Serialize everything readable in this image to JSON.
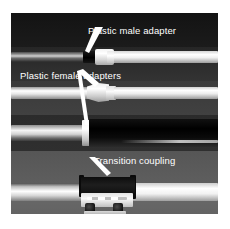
{
  "figure": {
    "kind": "photograph",
    "background_color": "#ffffff",
    "photo_background_color": "#2e2e2e",
    "label_color": "#ffffff",
    "leader_color": "#ffffff"
  },
  "annotations": [
    {
      "id": "plastic-male-adapter",
      "text": "Plastic male adapter",
      "target": "white threaded fitting on the upper dark pipe"
    },
    {
      "id": "plastic-female-adapters",
      "text": "Plastic female adapters",
      "target": "tapered white fittings on the second and third pipes"
    },
    {
      "id": "transition-coupling",
      "text": "Transition coupling",
      "target": "banded rubber sleeve clamp on the bottom pipe"
    }
  ],
  "pipes": [
    {
      "id": "pipe-row-1",
      "description": "dark pipe joined to light pipe by a plastic male adapter"
    },
    {
      "id": "pipe-row-2",
      "description": "light pipe with a tapered plastic female adapter"
    },
    {
      "id": "pipe-row-3",
      "description": "light pipe with white collar joined to a large black pipe"
    },
    {
      "id": "pipe-row-4",
      "description": "light pipe joined by a banded transition coupling"
    }
  ]
}
